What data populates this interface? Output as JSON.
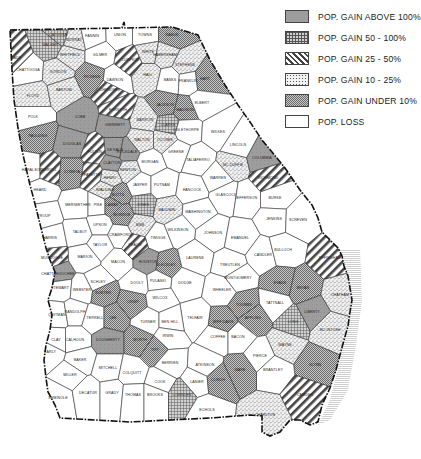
{
  "legend": {
    "items": [
      {
        "key": "above100",
        "label": "POP. GAIN  ABOVE 100%",
        "pattern": "solid-gray",
        "color": "#9a9a9a"
      },
      {
        "key": "50to100",
        "label": "POP. GAIN  50 - 100%",
        "pattern": "crosshatch-grid",
        "color": "#8a8a8a"
      },
      {
        "key": "25to50",
        "label": "POP. GAIN  25 - 50%",
        "pattern": "diagonal-stripes",
        "color": "#555555"
      },
      {
        "key": "10to25",
        "label": "POP. GAIN  10 - 25%",
        "pattern": "stipple-dots",
        "color": "#bdbdbd"
      },
      {
        "key": "under10",
        "label": "POP. GAIN  UNDER 10%",
        "pattern": "fine-checker",
        "color": "#a8a8a8"
      },
      {
        "key": "loss",
        "label": "POP. LOSS",
        "pattern": "white",
        "color": "#ffffff"
      }
    ]
  },
  "map": {
    "region": "Georgia counties",
    "counties": [
      {
        "name": "DADE",
        "cat": "25to50",
        "x": 16,
        "y": 58
      },
      {
        "name": "WALKER",
        "cat": "50to100",
        "x": 50,
        "y": 45
      },
      {
        "name": "CATOOSA",
        "cat": "50to100",
        "x": 58,
        "y": 35
      },
      {
        "name": "WHITFIELD",
        "cat": "10to25",
        "x": 70,
        "y": 55
      },
      {
        "name": "MURRAY",
        "cat": "10to25",
        "x": 74,
        "y": 40
      },
      {
        "name": "CHATTOOGA",
        "cat": "loss",
        "x": 28,
        "y": 70
      },
      {
        "name": "GORDON",
        "cat": "10to25",
        "x": 58,
        "y": 72
      },
      {
        "name": "FLOYD",
        "cat": "10to25",
        "x": 33,
        "y": 96
      },
      {
        "name": "BARTOW",
        "cat": "10to25",
        "x": 64,
        "y": 90
      },
      {
        "name": "FANNIN",
        "cat": "loss",
        "x": 92,
        "y": 36
      },
      {
        "name": "GILMER",
        "cat": "loss",
        "x": 100,
        "y": 55
      },
      {
        "name": "PICKENS",
        "cat": "under10",
        "x": 92,
        "y": 77
      },
      {
        "name": "CHEROKEE",
        "cat": "25to50",
        "x": 110,
        "y": 90
      },
      {
        "name": "DAWSON",
        "cat": "loss",
        "x": 115,
        "y": 80
      },
      {
        "name": "UNION",
        "cat": "loss",
        "x": 120,
        "y": 35
      },
      {
        "name": "TOWNS",
        "cat": "loss",
        "x": 145,
        "y": 35
      },
      {
        "name": "RABUN",
        "cat": "under10",
        "x": 172,
        "y": 35
      },
      {
        "name": "LUMPKIN",
        "cat": "25to50",
        "x": 130,
        "y": 60
      },
      {
        "name": "WHITE",
        "cat": "10to25",
        "x": 148,
        "y": 52
      },
      {
        "name": "HABERSHAM",
        "cat": "10to25",
        "x": 165,
        "y": 55
      },
      {
        "name": "STEPHENS",
        "cat": "10to25",
        "x": 185,
        "y": 65
      },
      {
        "name": "HALL",
        "cat": "10to25",
        "x": 148,
        "y": 75
      },
      {
        "name": "BANKS",
        "cat": "loss",
        "x": 170,
        "y": 80
      },
      {
        "name": "FRANKLIN",
        "cat": "loss",
        "x": 188,
        "y": 81
      },
      {
        "name": "HART",
        "cat": "under10",
        "x": 205,
        "y": 79
      },
      {
        "name": "POLK",
        "cat": "loss",
        "x": 33,
        "y": 117
      },
      {
        "name": "PAULDING",
        "cat": "under10",
        "x": 38,
        "y": 136
      },
      {
        "name": "COBB",
        "cat": "above100",
        "x": 80,
        "y": 117
      },
      {
        "name": "DOUGLAS",
        "cat": "above100",
        "x": 72,
        "y": 144
      },
      {
        "name": "FORSYTH",
        "cat": "25to50",
        "x": 118,
        "y": 110
      },
      {
        "name": "GWINNETT",
        "cat": "above100",
        "x": 115,
        "y": 125
      },
      {
        "name": "JACKSON",
        "cat": "under10",
        "x": 165,
        "y": 105
      },
      {
        "name": "MADISON",
        "cat": "under10",
        "x": 185,
        "y": 110
      },
      {
        "name": "ELBERT",
        "cat": "loss",
        "x": 202,
        "y": 103
      },
      {
        "name": "DE KALB",
        "cat": "above100",
        "x": 115,
        "y": 150
      },
      {
        "name": "FULTON",
        "cat": "25to50",
        "x": 95,
        "y": 152
      },
      {
        "name": "CLAYTON",
        "cat": "above100",
        "x": 112,
        "y": 163
      },
      {
        "name": "ROCKDALE",
        "cat": "above100",
        "x": 127,
        "y": 152
      },
      {
        "name": "BARROW",
        "cat": "10to25",
        "x": 145,
        "y": 120
      },
      {
        "name": "CLARKE",
        "cat": "50to100",
        "x": 168,
        "y": 125
      },
      {
        "name": "OGLETHORPE",
        "cat": "loss",
        "x": 186,
        "y": 130
      },
      {
        "name": "OCONEE",
        "cat": "10to25",
        "x": 165,
        "y": 140
      },
      {
        "name": "WALTON",
        "cat": "10to25",
        "x": 142,
        "y": 140
      },
      {
        "name": "WILKES",
        "cat": "loss",
        "x": 218,
        "y": 132
      },
      {
        "name": "LINCOLN",
        "cat": "loss",
        "x": 238,
        "y": 145
      },
      {
        "name": "HARALSON",
        "cat": "loss",
        "x": 32,
        "y": 170
      },
      {
        "name": "CARROLL",
        "cat": "25to50",
        "x": 48,
        "y": 170
      },
      {
        "name": "COWETA",
        "cat": "under10",
        "x": 72,
        "y": 172
      },
      {
        "name": "FAYETTE",
        "cat": "25to50",
        "x": 92,
        "y": 175
      },
      {
        "name": "HENRY",
        "cat": "10to25",
        "x": 110,
        "y": 178
      },
      {
        "name": "NEWTON",
        "cat": "10to25",
        "x": 128,
        "y": 170
      },
      {
        "name": "MORGAN",
        "cat": "loss",
        "x": 150,
        "y": 162
      },
      {
        "name": "GREENE",
        "cat": "loss",
        "x": 176,
        "y": 152
      },
      {
        "name": "TALIAFERRO",
        "cat": "loss",
        "x": 198,
        "y": 160
      },
      {
        "name": "MC DUFFIE",
        "cat": "10to25",
        "x": 233,
        "y": 165
      },
      {
        "name": "COLUMBIA",
        "cat": "above100",
        "x": 262,
        "y": 158
      },
      {
        "name": "RICHMOND",
        "cat": "25to50",
        "x": 268,
        "y": 178
      },
      {
        "name": "JASPER",
        "cat": "loss",
        "x": 140,
        "y": 185
      },
      {
        "name": "PUTNAM",
        "cat": "loss",
        "x": 162,
        "y": 185
      },
      {
        "name": "HANCOCK",
        "cat": "loss",
        "x": 192,
        "y": 190
      },
      {
        "name": "WARREN",
        "cat": "loss",
        "x": 218,
        "y": 178
      },
      {
        "name": "GLASCOCK",
        "cat": "loss",
        "x": 226,
        "y": 195
      },
      {
        "name": "JEFFERSON",
        "cat": "loss",
        "x": 246,
        "y": 198
      },
      {
        "name": "BURKE",
        "cat": "loss",
        "x": 275,
        "y": 198
      },
      {
        "name": "HEARD",
        "cat": "loss",
        "x": 40,
        "y": 190
      },
      {
        "name": "TROUP",
        "cat": "loss",
        "x": 44,
        "y": 216
      },
      {
        "name": "MERIWETHER",
        "cat": "loss",
        "x": 78,
        "y": 205
      },
      {
        "name": "PIKE",
        "cat": "loss",
        "x": 98,
        "y": 205
      },
      {
        "name": "SPALDING",
        "cat": "10to25",
        "x": 105,
        "y": 190
      },
      {
        "name": "BUTTS",
        "cat": "under10",
        "x": 118,
        "y": 195
      },
      {
        "name": "LAMAR",
        "cat": "under10",
        "x": 112,
        "y": 205
      },
      {
        "name": "MONROE",
        "cat": "under10",
        "x": 122,
        "y": 215
      },
      {
        "name": "JONES",
        "cat": "50to100",
        "x": 143,
        "y": 205
      },
      {
        "name": "BALDWIN",
        "cat": "10to25",
        "x": 167,
        "y": 210
      },
      {
        "name": "WASHINGTON",
        "cat": "loss",
        "x": 198,
        "y": 212
      },
      {
        "name": "HARRIS",
        "cat": "loss",
        "x": 50,
        "y": 238
      },
      {
        "name": "TALBOT",
        "cat": "loss",
        "x": 80,
        "y": 232
      },
      {
        "name": "UPSON",
        "cat": "loss",
        "x": 100,
        "y": 225
      },
      {
        "name": "CRAWFORD",
        "cat": "loss",
        "x": 120,
        "y": 235
      },
      {
        "name": "BIBB",
        "cat": "10to25",
        "x": 140,
        "y": 225
      },
      {
        "name": "TWIGGS",
        "cat": "loss",
        "x": 158,
        "y": 238
      },
      {
        "name": "WILKINSON",
        "cat": "loss",
        "x": 178,
        "y": 230
      },
      {
        "name": "JOHNSON",
        "cat": "loss",
        "x": 213,
        "y": 233
      },
      {
        "name": "EMANUEL",
        "cat": "loss",
        "x": 240,
        "y": 238
      },
      {
        "name": "JENKINS",
        "cat": "loss",
        "x": 274,
        "y": 219
      },
      {
        "name": "SCREVEN",
        "cat": "loss",
        "x": 298,
        "y": 220
      },
      {
        "name": "MUSCOGEE",
        "cat": "25to50",
        "x": 52,
        "y": 258
      },
      {
        "name": "CHATTAHOOCHEE",
        "cat": "above100",
        "x": 58,
        "y": 274
      },
      {
        "name": "MARION",
        "cat": "loss",
        "x": 85,
        "y": 257
      },
      {
        "name": "TAYLOR",
        "cat": "loss",
        "x": 100,
        "y": 245
      },
      {
        "name": "MACON",
        "cat": "loss",
        "x": 118,
        "y": 262
      },
      {
        "name": "PEACH",
        "cat": "25to50",
        "x": 135,
        "y": 245
      },
      {
        "name": "HOUSTON",
        "cat": "above100",
        "x": 148,
        "y": 262
      },
      {
        "name": "BLECKLEY",
        "cat": "under10",
        "x": 166,
        "y": 265
      },
      {
        "name": "LAURENS",
        "cat": "loss",
        "x": 195,
        "y": 258
      },
      {
        "name": "TREUTLEN",
        "cat": "loss",
        "x": 230,
        "y": 265
      },
      {
        "name": "CANDLER",
        "cat": "loss",
        "x": 263,
        "y": 255
      },
      {
        "name": "BULLOCH",
        "cat": "loss",
        "x": 283,
        "y": 250
      },
      {
        "name": "EFFINGHAM",
        "cat": "25to50",
        "x": 330,
        "y": 258
      },
      {
        "name": "STEWART",
        "cat": "loss",
        "x": 60,
        "y": 288
      },
      {
        "name": "WEBSTER",
        "cat": "loss",
        "x": 82,
        "y": 290
      },
      {
        "name": "SCHLEY",
        "cat": "loss",
        "x": 98,
        "y": 282
      },
      {
        "name": "SUMTER",
        "cat": "under10",
        "x": 103,
        "y": 293
      },
      {
        "name": "DOOLY",
        "cat": "loss",
        "x": 137,
        "y": 283
      },
      {
        "name": "PULASKI",
        "cat": "loss",
        "x": 158,
        "y": 281
      },
      {
        "name": "DODGE",
        "cat": "loss",
        "x": 185,
        "y": 283
      },
      {
        "name": "WHEELER",
        "cat": "loss",
        "x": 222,
        "y": 290
      },
      {
        "name": "MONTGOMERY",
        "cat": "loss",
        "x": 238,
        "y": 278
      },
      {
        "name": "TOOMBS",
        "cat": "under10",
        "x": 244,
        "y": 305
      },
      {
        "name": "EVANS",
        "cat": "under10",
        "x": 280,
        "y": 283
      },
      {
        "name": "TATTNALL",
        "cat": "loss",
        "x": 275,
        "y": 303
      },
      {
        "name": "BRYAN",
        "cat": "under10",
        "x": 303,
        "y": 288
      },
      {
        "name": "CHATHAM",
        "cat": "10to25",
        "x": 340,
        "y": 295
      },
      {
        "name": "QUITMAN",
        "cat": "loss",
        "x": 57,
        "y": 315
      },
      {
        "name": "RANDOLPH",
        "cat": "loss",
        "x": 75,
        "y": 312
      },
      {
        "name": "TERRELL",
        "cat": "loss",
        "x": 95,
        "y": 318
      },
      {
        "name": "LEE",
        "cat": "under10",
        "x": 113,
        "y": 318
      },
      {
        "name": "CRISP",
        "cat": "under10",
        "x": 133,
        "y": 302
      },
      {
        "name": "WILCOX",
        "cat": "loss",
        "x": 160,
        "y": 298
      },
      {
        "name": "TELFAIR",
        "cat": "loss",
        "x": 195,
        "y": 318
      },
      {
        "name": "JEFF DAVIS",
        "cat": "under10",
        "x": 223,
        "y": 322
      },
      {
        "name": "APPLING",
        "cat": "under10",
        "x": 253,
        "y": 318
      },
      {
        "name": "LIBERTY",
        "cat": "above100",
        "x": 312,
        "y": 312
      },
      {
        "name": "LONG",
        "cat": "50to100",
        "x": 293,
        "y": 322
      },
      {
        "name": "MC INTOSH",
        "cat": "10to25",
        "x": 330,
        "y": 330
      },
      {
        "name": "CLAY",
        "cat": "loss",
        "x": 56,
        "y": 340
      },
      {
        "name": "CALHOUN",
        "cat": "loss",
        "x": 75,
        "y": 340
      },
      {
        "name": "DOUGHERTY",
        "cat": "above100",
        "x": 108,
        "y": 340
      },
      {
        "name": "TURNER",
        "cat": "loss",
        "x": 148,
        "y": 322
      },
      {
        "name": "BEN HILL",
        "cat": "loss",
        "x": 170,
        "y": 322
      },
      {
        "name": "IRWIN",
        "cat": "loss",
        "x": 168,
        "y": 336
      },
      {
        "name": "COFFEE",
        "cat": "loss",
        "x": 218,
        "y": 337
      },
      {
        "name": "BACON",
        "cat": "loss",
        "x": 238,
        "y": 337
      },
      {
        "name": "WAYNE",
        "cat": "10to25",
        "x": 285,
        "y": 345
      },
      {
        "name": "GLYNN",
        "cat": "under10",
        "x": 315,
        "y": 365
      },
      {
        "name": "EARLY",
        "cat": "loss",
        "x": 50,
        "y": 352
      },
      {
        "name": "BAKER",
        "cat": "loss",
        "x": 80,
        "y": 360
      },
      {
        "name": "MITCHELL",
        "cat": "loss",
        "x": 108,
        "y": 368
      },
      {
        "name": "WORTH",
        "cat": "under10",
        "x": 140,
        "y": 340
      },
      {
        "name": "TIFT",
        "cat": "under10",
        "x": 155,
        "y": 350
      },
      {
        "name": "BERRIEN",
        "cat": "loss",
        "x": 170,
        "y": 363
      },
      {
        "name": "ATKINSON",
        "cat": "loss",
        "x": 205,
        "y": 365
      },
      {
        "name": "PIERCE",
        "cat": "loss",
        "x": 260,
        "y": 356
      },
      {
        "name": "BRANTLEY",
        "cat": "loss",
        "x": 273,
        "y": 370
      },
      {
        "name": "MILLER",
        "cat": "loss",
        "x": 70,
        "y": 375
      },
      {
        "name": "COLQUITT",
        "cat": "loss",
        "x": 132,
        "y": 373
      },
      {
        "name": "COOK",
        "cat": "loss",
        "x": 160,
        "y": 382
      },
      {
        "name": "LANIER",
        "cat": "loss",
        "x": 197,
        "y": 382
      },
      {
        "name": "WARE",
        "cat": "under10",
        "x": 240,
        "y": 370
      },
      {
        "name": "CAMDEN",
        "cat": "25to50",
        "x": 305,
        "y": 395
      },
      {
        "name": "SEMINOLE",
        "cat": "loss",
        "x": 58,
        "y": 398
      },
      {
        "name": "DECATUR",
        "cat": "loss",
        "x": 88,
        "y": 393
      },
      {
        "name": "GRADY",
        "cat": "loss",
        "x": 112,
        "y": 393
      },
      {
        "name": "THOMAS",
        "cat": "loss",
        "x": 133,
        "y": 395
      },
      {
        "name": "BROOKS",
        "cat": "loss",
        "x": 155,
        "y": 395
      },
      {
        "name": "LOWNDES",
        "cat": "50to100",
        "x": 182,
        "y": 395
      },
      {
        "name": "ECHOLS",
        "cat": "loss",
        "x": 207,
        "y": 410
      },
      {
        "name": "CLINCH",
        "cat": "under10",
        "x": 218,
        "y": 380
      },
      {
        "name": "CHARLTON",
        "cat": "10to25",
        "x": 265,
        "y": 415
      }
    ]
  }
}
